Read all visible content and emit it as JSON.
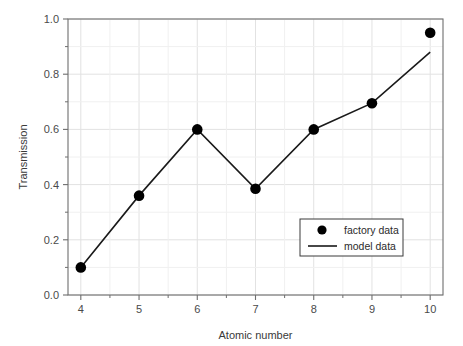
{
  "chart_data": {
    "type": "line",
    "title": "",
    "xlabel": "Atomic number",
    "ylabel": "Transmission",
    "xlim": [
      3.78,
      10.22
    ],
    "ylim": [
      0.0,
      1.0
    ],
    "grid": true,
    "legend_position": "lower-right-inside",
    "x": [
      4,
      5,
      6,
      7,
      8,
      9,
      10
    ],
    "xticks": [
      "4",
      "5",
      "6",
      "7",
      "8",
      "9",
      "10"
    ],
    "xtick_values": [
      4,
      5,
      6,
      7,
      8,
      9,
      10
    ],
    "x_minor_ticks": [
      4.5,
      5.5,
      6.5,
      7.5,
      8.5,
      9.5
    ],
    "yticks": [
      "0.0",
      "0.2",
      "0.4",
      "0.6",
      "0.8",
      "1.0"
    ],
    "ytick_values": [
      0.0,
      0.2,
      0.4,
      0.6,
      0.8,
      1.0
    ],
    "y_minor_ticks": [
      0.1,
      0.3,
      0.5,
      0.7,
      0.9
    ],
    "series": [
      {
        "name": "factory data",
        "style": "marker",
        "marker": "filled-circle",
        "color": "#000000",
        "values": [
          0.1,
          0.36,
          0.6,
          0.385,
          0.6,
          0.695,
          0.95
        ]
      },
      {
        "name": "model data",
        "style": "line",
        "color": "#1a1a1a",
        "values": [
          0.1,
          0.36,
          0.6,
          0.385,
          0.6,
          0.695,
          0.88
        ]
      }
    ],
    "colors": {
      "background": "#ffffff",
      "axis": "#6e6e6e",
      "grid": "#e2e2e2",
      "marker": "#000000",
      "line": "#1a1a1a",
      "text": "#3a3a3a"
    }
  },
  "legend": {
    "entries": [
      {
        "label": "factory data",
        "symbol": "filled-circle"
      },
      {
        "label": "model data",
        "symbol": "line-segment"
      }
    ]
  }
}
